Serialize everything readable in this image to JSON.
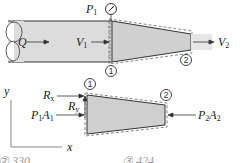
{
  "figure": {
    "top": {
      "labels": {
        "flow_rate": "Q",
        "velocity_in": {
          "base": "V",
          "sub": "1"
        },
        "velocity_out": {
          "base": "V",
          "sub": "2"
        },
        "pressure_gauge": {
          "base": "P",
          "sub": "1"
        },
        "section_1": "1",
        "section_2": "2"
      }
    },
    "bottom": {
      "labels": {
        "axis_y": "y",
        "axis_x": "x",
        "reaction_x": {
          "base": "R",
          "sub": "x"
        },
        "reaction_y": {
          "base": "R",
          "sub": "y"
        },
        "pressure_force_in": {
          "base": "P",
          "sub": "1",
          "base2": "A",
          "sub2": "1"
        },
        "pressure_force_out": {
          "base": "P",
          "sub": "2",
          "base2": "A",
          "sub2": "2"
        },
        "section_1": "1",
        "section_2": "2"
      }
    },
    "clipped_answers": {
      "left": "② 330",
      "right": "③ 424"
    },
    "colors": {
      "fill": "#d4d4d4",
      "pipe_fill": "#dcdcdc",
      "jet_fill": "#e6e6e6",
      "stroke": "#333333"
    }
  }
}
